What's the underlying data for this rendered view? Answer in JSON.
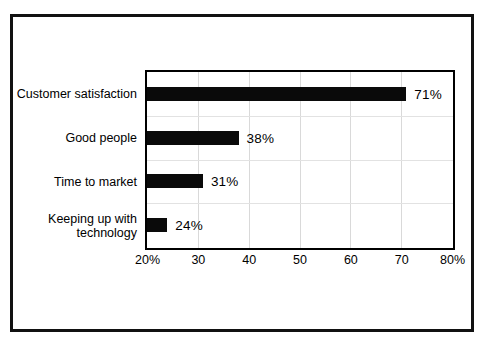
{
  "chart_data": {
    "type": "bar",
    "orientation": "horizontal",
    "title": "",
    "subtitle": "",
    "xlabel": "",
    "ylabel": "",
    "xlim": [
      20,
      80
    ],
    "xticks": [
      20,
      30,
      40,
      50,
      60,
      70,
      80
    ],
    "xtick_labels": [
      "20%",
      "30",
      "40",
      "50",
      "60",
      "70",
      "80%"
    ],
    "grid": true,
    "legend": false,
    "bar_color": "#0a0a0a",
    "categories": [
      "Customer satisfaction",
      "Good people",
      "Time to market",
      "Keeping up with\ntechnology"
    ],
    "values": [
      71,
      38,
      31,
      24
    ],
    "value_labels": [
      "71%",
      "38%",
      "31%",
      "24%"
    ]
  },
  "colors": {
    "bar": "#0a0a0a",
    "frame": "#111111",
    "plot_border": "#000000",
    "gridline": "#d9d9d9",
    "background": "#ffffff",
    "text": "#000000"
  }
}
